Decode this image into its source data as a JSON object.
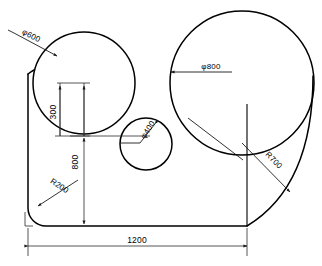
{
  "drawing": {
    "title": "Engineering outline drawing with circles and radii",
    "background_color": "#ffffff",
    "line_color": "#000000",
    "dimension_color": "#2b2b2b",
    "width_px": 322,
    "height_px": 266
  },
  "dimensions": {
    "diameter_left_circle": "φ600",
    "diameter_right_circle": "φ800",
    "diameter_middle_circle": "φ400",
    "radius_bottom_left_fillet": "R200",
    "radius_right_sweep": "R700",
    "vertical_300": "300",
    "vertical_800": "800",
    "horizontal_1200": "1200"
  },
  "geometry": {
    "left_circle": {
      "cx": 84,
      "cy": 83,
      "r": 51
    },
    "right_circle": {
      "cx": 242,
      "cy": 83,
      "r": 72
    },
    "middle_circle": {
      "cx": 146,
      "cy": 144,
      "r": 26
    },
    "outline_left_x": 28,
    "outline_bottom_y": 226,
    "outline_right_x": 247,
    "fillet_radius": 18,
    "baseline_dim_y": 246
  }
}
